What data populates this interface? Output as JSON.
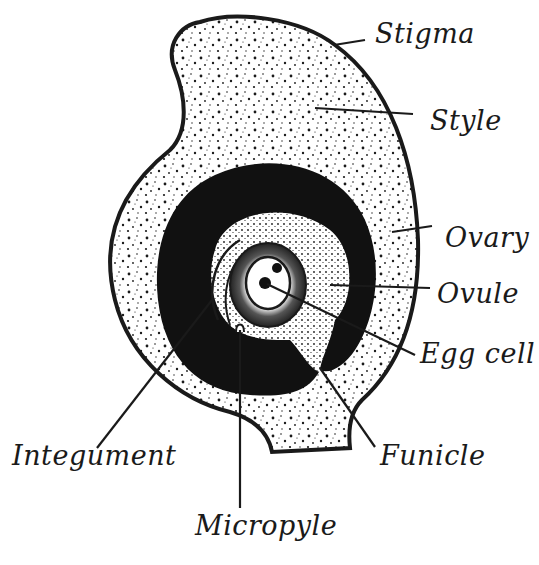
{
  "diagram": {
    "colors": {
      "ink": "#1a1a1a",
      "paper": "#ffffff",
      "ovary_cavity": "#111111"
    },
    "labels": [
      {
        "id": "stigma",
        "text": "Stigma",
        "x": 375,
        "y": 18
      },
      {
        "id": "style",
        "text": "Style",
        "x": 430,
        "y": 105
      },
      {
        "id": "ovary",
        "text": "Ovary",
        "x": 445,
        "y": 222
      },
      {
        "id": "ovule",
        "text": "Ovule",
        "x": 437,
        "y": 278
      },
      {
        "id": "egg-cell",
        "text": "Egg cell",
        "x": 420,
        "y": 338
      },
      {
        "id": "funicle",
        "text": "Funicle",
        "x": 380,
        "y": 440
      },
      {
        "id": "integument",
        "text": "Integument",
        "x": 12,
        "y": 440
      },
      {
        "id": "micropyle",
        "text": "Micropyle",
        "x": 195,
        "y": 510
      }
    ]
  }
}
